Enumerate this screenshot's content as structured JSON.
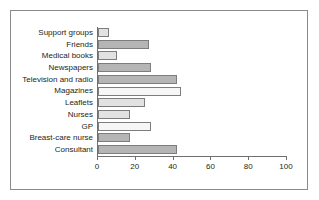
{
  "chart_data": {
    "type": "bar",
    "orientation": "horizontal",
    "title": "",
    "xlabel": "",
    "ylabel": "",
    "xlim": [
      0,
      100
    ],
    "xticks": [
      0,
      20,
      40,
      60,
      80,
      100
    ],
    "grid": false,
    "legend": "none",
    "categories": [
      "Support groups",
      "Friends",
      "Medical books",
      "Newspapers",
      "Television and radio",
      "Magazines",
      "Leaflets",
      "Nurses",
      "GP",
      "Breast-care nurse",
      "Consultant"
    ],
    "values": [
      6,
      27,
      10,
      28,
      42,
      44,
      25,
      17,
      28,
      17,
      42
    ],
    "bar_styles": [
      "light",
      "medium",
      "light",
      "medium",
      "medium",
      "pale",
      "light",
      "light",
      "pale",
      "medium",
      "medium"
    ],
    "colors": {
      "light": "#e2e2e2",
      "medium": "#b5b5b5",
      "pale": "#f6f6f6",
      "bar_outline": "#7d7d7d",
      "axis": "#6f6f6f",
      "frame": "#8a8a8a",
      "text": "#231f20"
    }
  }
}
